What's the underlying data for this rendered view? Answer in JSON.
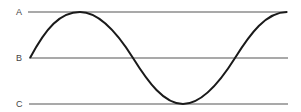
{
  "diagram": {
    "type": "sine-wave-reference-lines",
    "labels": {
      "a": "A",
      "b": "B",
      "c": "C"
    },
    "colors": {
      "lines": "#555555",
      "wave": "#1a1a1a",
      "labels": "#444444"
    }
  }
}
